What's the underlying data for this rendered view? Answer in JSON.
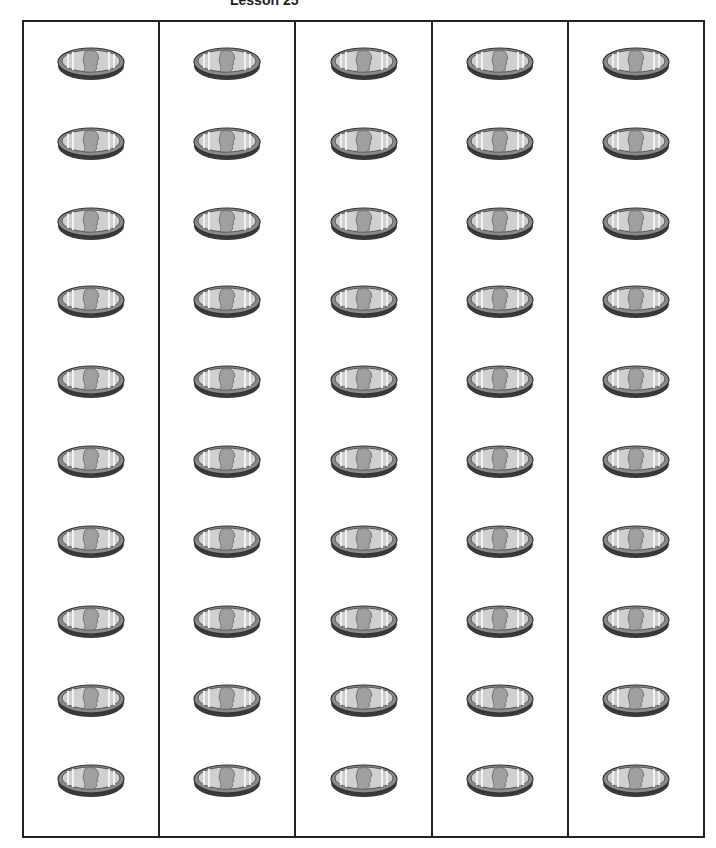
{
  "header": {
    "title": "Lesson 25"
  },
  "grid": {
    "columns": 5,
    "rows": 10,
    "row_centers": [
      40,
      120,
      200,
      278,
      358,
      438,
      518,
      598,
      677,
      757
    ],
    "coin_type": "penny",
    "colors": {
      "border": "#222222",
      "coin_face": "#c8c8c8",
      "coin_rim": "#555555",
      "coin_edge": "#8a8a8a"
    }
  }
}
